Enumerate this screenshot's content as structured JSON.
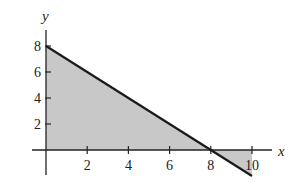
{
  "chart_data": {
    "type": "area",
    "title": "",
    "xlabel": "x",
    "ylabel": "y",
    "xlim": [
      -1,
      11
    ],
    "ylim": [
      -3,
      9.5
    ],
    "grid": false,
    "x_ticks": [
      2,
      4,
      6,
      8,
      10
    ],
    "y_ticks": [
      2,
      4,
      6,
      8
    ],
    "x_tick_labels": [
      "2",
      "4",
      "6",
      "8",
      "10"
    ],
    "y_tick_labels": [
      "2",
      "4",
      "6",
      "8"
    ],
    "line": {
      "equation": "y = 8 - x",
      "points": [
        [
          0,
          8
        ],
        [
          10,
          -2
        ]
      ],
      "color": "#1a1a1a"
    },
    "shaded_regions": [
      {
        "name": "region-above-axis",
        "vertices": [
          [
            0,
            0
          ],
          [
            0,
            8
          ],
          [
            8,
            0
          ]
        ],
        "color": "#c8c8c8"
      },
      {
        "name": "region-below-axis",
        "vertices": [
          [
            8,
            0
          ],
          [
            10,
            0
          ],
          [
            10,
            -2
          ]
        ],
        "color": "#c8c8c8"
      }
    ]
  }
}
